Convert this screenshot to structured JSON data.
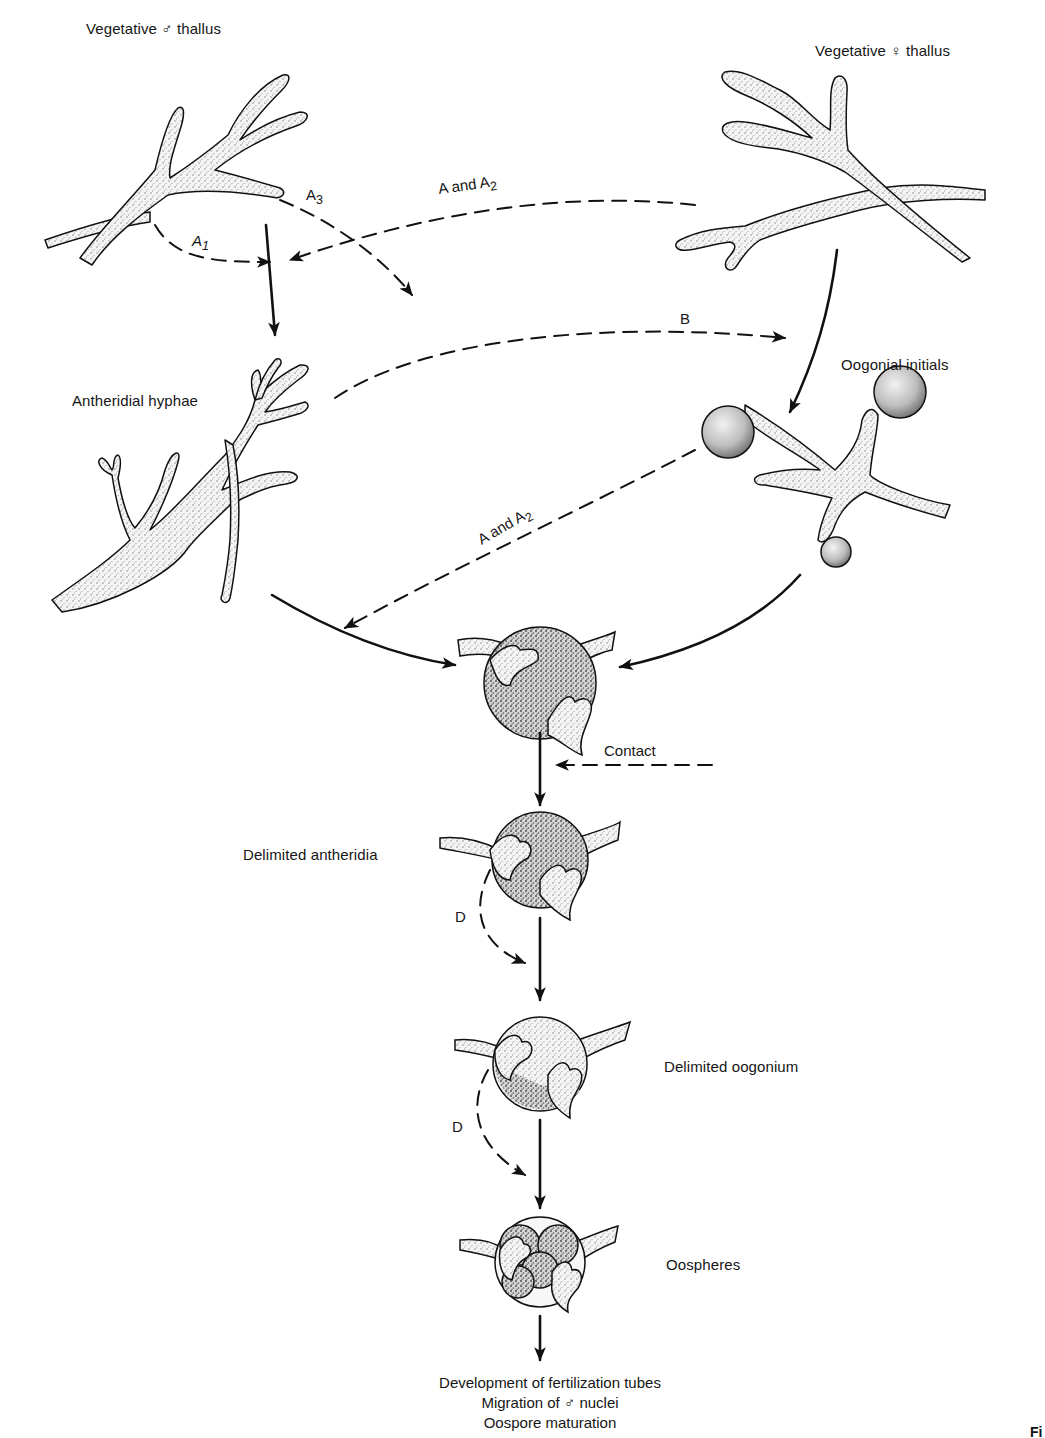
{
  "diagram": {
    "type": "sexual-reproduction-hormone-pathway",
    "stages": {
      "male_thallus": {
        "label": "Vegetative ♂ thallus"
      },
      "female_thallus": {
        "label": "Vegetative ♀ thallus"
      },
      "antheridial_hyphae": {
        "label": "Antheridial hyphae"
      },
      "oogonial_initials": {
        "label": "Oogonial initials"
      },
      "contact_stage": {
        "label": ""
      },
      "delimited_antheridia": {
        "label": "Delimited antheridia"
      },
      "delimited_oogonium": {
        "label": "Delimited oogonium"
      },
      "oospheres": {
        "label": "Oospheres"
      }
    },
    "hormone_labels": {
      "a1": {
        "main": "A",
        "sub": "1"
      },
      "a3": {
        "main": "A",
        "sub": "3"
      },
      "a_and_a2_top": {
        "main": "A and A",
        "sub": "2"
      },
      "a_and_a2_mid": {
        "main": "A and A",
        "sub": "2"
      },
      "b": "B",
      "contact": "Contact",
      "d1": "D",
      "d2": "D"
    },
    "footer": {
      "line1": "Development of fertilization tubes",
      "line2": "Migration of ♂ nuclei",
      "line3": "Oospore maturation"
    },
    "figure_tag": "Fi"
  },
  "colors": {
    "ink": "#111111",
    "background": "#ffffff",
    "stipple": "#cfcfcf"
  }
}
